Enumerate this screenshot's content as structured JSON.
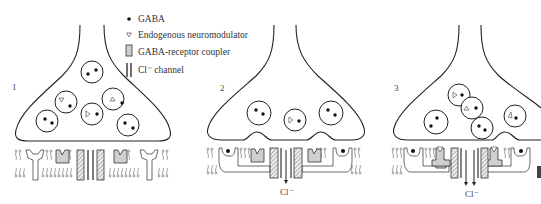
{
  "figure": {
    "legend": [
      {
        "icon": "dot-icon",
        "label": "GABA"
      },
      {
        "icon": "triangle-icon",
        "label": "Endogenous neuromodulator"
      },
      {
        "icon": "coupler-icon",
        "label": "GABA-receptor coupler"
      },
      {
        "icon": "channel-icon",
        "label": "Cl⁻ channel"
      }
    ],
    "panels": [
      {
        "number": "1",
        "ion_label": ""
      },
      {
        "number": "2",
        "ion_label": "Cl⁻"
      },
      {
        "number": "3",
        "ion_label": "Cl⁻"
      }
    ]
  }
}
